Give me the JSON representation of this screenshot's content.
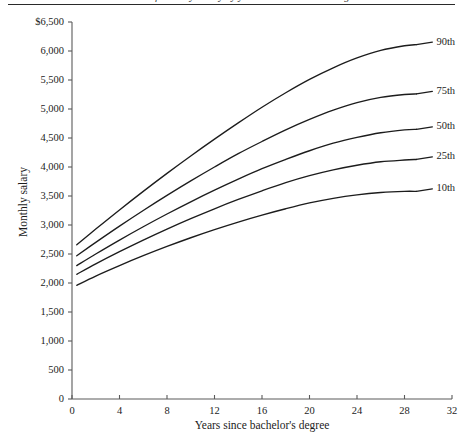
{
  "figure": {
    "caption_cropped": "Percentiles of monthly salary by years since bachelor's degree",
    "axis_color": "#5a5a5a",
    "line_color": "#1c1c1c",
    "background": "#ffffff"
  },
  "chart_data": {
    "type": "line",
    "title": "",
    "xlabel": "Years since bachelor's degree",
    "ylabel": "Monthly salary",
    "xlim": [
      0,
      32
    ],
    "ylim": [
      0,
      6500
    ],
    "grid": false,
    "legend_position": "right-inline",
    "x_ticks": [
      "0",
      "4",
      "8",
      "12",
      "16",
      "20",
      "24",
      "28",
      "32"
    ],
    "x_tick_values": [
      0,
      4,
      8,
      12,
      16,
      20,
      24,
      28,
      32
    ],
    "y_ticks": [
      "0",
      "500",
      "1,000",
      "1,500",
      "2,000",
      "2,500",
      "3,000",
      "3,500",
      "4,000",
      "4,500",
      "5,000",
      "5,500",
      "6,000",
      "$6,500"
    ],
    "y_tick_values": [
      0,
      500,
      1000,
      1500,
      2000,
      2500,
      3000,
      3500,
      4000,
      4500,
      5000,
      5500,
      6000,
      6500
    ],
    "x": [
      0.4,
      2,
      4,
      6,
      8,
      10,
      12,
      14,
      16,
      18,
      20,
      22,
      24,
      26,
      28,
      29
    ],
    "series": [
      {
        "name": "90th",
        "label": "90th",
        "values": [
          2660,
          2930,
          3260,
          3580,
          3890,
          4190,
          4480,
          4760,
          5030,
          5280,
          5510,
          5710,
          5880,
          6010,
          6090,
          6110
        ]
      },
      {
        "name": "75th",
        "label": "75th",
        "values": [
          2470,
          2700,
          2980,
          3250,
          3510,
          3760,
          4000,
          4230,
          4440,
          4640,
          4820,
          4980,
          5110,
          5200,
          5250,
          5260
        ]
      },
      {
        "name": "50th",
        "label": "50th",
        "values": [
          2300,
          2500,
          2740,
          2970,
          3190,
          3400,
          3600,
          3790,
          3970,
          4130,
          4280,
          4410,
          4510,
          4590,
          4640,
          4650
        ]
      },
      {
        "name": "25th",
        "label": "25th",
        "values": [
          2150,
          2330,
          2540,
          2740,
          2930,
          3110,
          3280,
          3440,
          3590,
          3730,
          3850,
          3950,
          4030,
          4090,
          4120,
          4130
        ]
      },
      {
        "name": "10th",
        "label": "10th",
        "values": [
          1960,
          2120,
          2300,
          2470,
          2630,
          2780,
          2920,
          3050,
          3170,
          3280,
          3380,
          3460,
          3520,
          3560,
          3580,
          3580
        ]
      }
    ]
  }
}
